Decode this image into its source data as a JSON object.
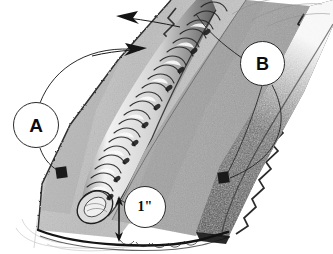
{
  "image": {
    "title": "Weld bead on plate - annotated technical sketch",
    "medium": "pencil-and-ink line drawing",
    "width": 333,
    "height": 254,
    "background_color": "#ffffff"
  },
  "callouts": [
    {
      "id": "a",
      "label": "A",
      "shape": "circle",
      "center": [
        36,
        125
      ],
      "radius": 23,
      "leader": "curved arc rising to the right, ending in a solid arrowhead aimed at the weld bead toe; second short leader drops down-right to a small filled square marker on the left plate edge",
      "target_marker": [
        62,
        172
      ],
      "refers_to": "weld bead / toe region on the near plate"
    },
    {
      "id": "b",
      "label": "B",
      "shape": "circle",
      "center": [
        262,
        63
      ],
      "radius": 22,
      "leader": "thin line running up-left to the plate bevel edge, plus a long curved leader sweeping down the right side to a small filled square marker",
      "target_marker": [
        224,
        177
      ],
      "refers_to": "dark heat-affected / far bevel face"
    },
    {
      "id": "dim",
      "label": "1\"",
      "shape": "circle",
      "center": [
        145,
        207
      ],
      "radius": 21,
      "leader": "short line to a vertical double-headed dimension arrow",
      "refers_to": "one inch dimension from bead end to plate bottom edge"
    }
  ],
  "dimension": {
    "value": "1\"",
    "unit": "inch",
    "orientation": "vertical",
    "arrow_x": 120,
    "arrow_top_y": 198,
    "arrow_bottom_y": 238,
    "style": "double-headed arrow"
  },
  "direction_arrows": [
    {
      "name": "travel-arrow-upper",
      "direction": "left",
      "tip": [
        119,
        17
      ],
      "tail": [
        173,
        24
      ],
      "meaning": "direction indicator along the joint"
    },
    {
      "name": "travel-arrow-lower",
      "direction": "right",
      "tip": [
        146,
        48
      ],
      "tail": [
        96,
        55
      ],
      "meaning": "direction of weld travel"
    }
  ],
  "regions": [
    {
      "name": "near-plate-face",
      "tone": "light speckled gray",
      "color": "#b9b9b9"
    },
    {
      "name": "weld-bead",
      "tone": "bright highlighted stacked ripples",
      "color": "#e8e8e8",
      "description": "stringer bead with overlapping crescent ripples, rounded crater at lower end"
    },
    {
      "name": "bead-toe-shadow",
      "tone": "dark jagged edge line",
      "color": "#2a2a2a"
    },
    {
      "name": "center-plate-face",
      "tone": "medium speckled gray",
      "color": "#a8a8a8"
    },
    {
      "name": "far-bevel-face",
      "tone": "dense dark stipple",
      "color": "#4a4a4a"
    },
    {
      "name": "plate-bottom-edge",
      "tone": "dark outline with light underside",
      "color": "#1e1e1e"
    },
    {
      "name": "construction-lines",
      "tone": "faint pencil guides at lower-left",
      "color": "#b0b0b0"
    }
  ],
  "colors": {
    "ink": "#1a1a1a",
    "bubble_fill": "#ffffff",
    "bubble_stroke": "#2b2b2b",
    "light_gray": "#cfcfcf",
    "mid_gray": "#9a9a9a",
    "dark_gray": "#4a4a4a",
    "near_black": "#151515"
  }
}
